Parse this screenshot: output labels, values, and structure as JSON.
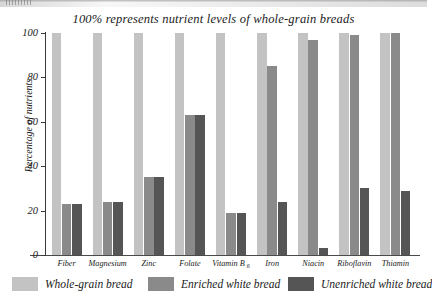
{
  "chart_data": {
    "type": "bar",
    "title": "100% represents nutrient levels of whole-grain breads",
    "xlabel": "",
    "ylabel": "Percentage of nutrients",
    "ylim": [
      0,
      100
    ],
    "yticks": [
      "0",
      "20",
      "40",
      "60",
      "80",
      "100"
    ],
    "grid": false,
    "legend_position": "bottom",
    "categories": [
      "Fiber",
      "Magnesium",
      "Zinc",
      "Folate",
      "Vitamin B",
      "Iron",
      "Niacin",
      "Riboflavin",
      "Thiamin"
    ],
    "category_subscripts": [
      "",
      "",
      "",
      "",
      "6",
      "",
      "",
      "",
      ""
    ],
    "series": [
      {
        "name": "Whole-grain bread",
        "color": "#c3c3c3",
        "values": [
          100,
          100,
          100,
          100,
          100,
          100,
          100,
          100,
          100
        ]
      },
      {
        "name": "Enriched white bread",
        "color": "#8a8a8a",
        "values": [
          23,
          24,
          35,
          63,
          19,
          85,
          97,
          99,
          100
        ]
      },
      {
        "name": "Unenriched white bread",
        "color": "#555555",
        "values": [
          23,
          24,
          35,
          63,
          19,
          24,
          3,
          30,
          29
        ]
      }
    ]
  },
  "axis": {
    "y_title": "Percentage of nutrients"
  }
}
